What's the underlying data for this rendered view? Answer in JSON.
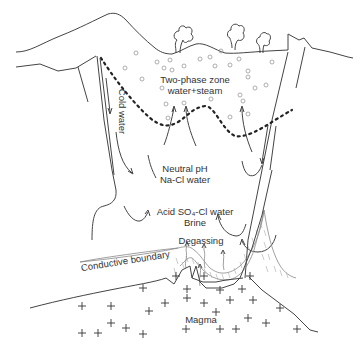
{
  "diagram": {
    "type": "geothermal-system-cross-section",
    "labels": {
      "two_phase_line1": "Two-phase zone",
      "two_phase_line2": "water+steam",
      "cold_water": "Cold water",
      "neutral_line1": "Neutral pH",
      "neutral_line2": "Na-Cl water",
      "acid_line1": "Acid SO₄-Cl water",
      "acid_line2": "Brine",
      "degassing": "Degassing",
      "conductive_boundary": "Conductive boundary",
      "magma": "Magma"
    },
    "colors": {
      "line": "#444444",
      "text": "#333333",
      "bubbles": "#999999",
      "hatch": "#aaaaaa"
    }
  }
}
